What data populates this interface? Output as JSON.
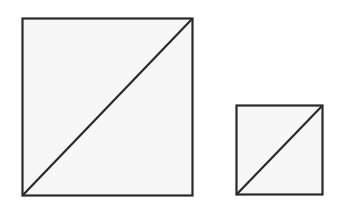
{
  "diagram": {
    "stroke_color": "#2a2a2a",
    "fill_color": "#f7f7f7",
    "shapes": [
      {
        "name": "large-square",
        "x": 22,
        "y": 18,
        "size": 171,
        "diagonal": "bottom-left to top-right"
      },
      {
        "name": "small-square",
        "x": 236,
        "y": 105,
        "size": 86,
        "diagonal": "bottom-left to top-right"
      }
    ]
  }
}
